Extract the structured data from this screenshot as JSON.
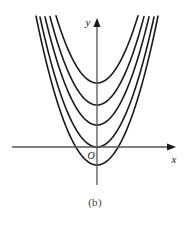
{
  "figure": {
    "caption": "(b)",
    "background_color": "#ffffff",
    "width": 190,
    "height": 226
  },
  "axes": {
    "x_label": "x",
    "y_label": "y",
    "origin_label": "O",
    "axis_color": "#555555",
    "arrow_color": "#1a1a1a",
    "x_axis": {
      "y_px": 147,
      "x_start_px": 12,
      "x_end_px": 176
    },
    "y_axis": {
      "x_px": 97,
      "y_start_px": 18,
      "y_end_px": 185
    }
  },
  "chart_data": {
    "type": "line",
    "title": "",
    "subtitle": "",
    "xlabel": "x",
    "ylabel": "y",
    "grid": false,
    "legend": "none",
    "axis_style": "arrowed-cartesian",
    "curve_color": "#1a1a1a",
    "curve_width_px": 1.6,
    "xlim": [
      -3.4,
      3.4
    ],
    "ylim": [
      -0.9,
      6.2
    ],
    "x_unit_px": 25,
    "y_unit_px": 25,
    "leading_coefficient": 1.0,
    "form": "y = x^2 + c",
    "series": [
      {
        "name": "y = x^2 - 0.72",
        "c": -0.72,
        "vertex": [
          0,
          -0.72
        ],
        "vertex_px": [
          97,
          165
        ]
      },
      {
        "name": "y = x^2 + 0.00",
        "c": 0.0,
        "vertex": [
          0,
          0.0
        ],
        "vertex_px": [
          97,
          147
        ]
      },
      {
        "name": "y = x^2 + 0.88",
        "c": 0.88,
        "vertex": [
          0,
          0.88
        ],
        "vertex_px": [
          97,
          125
        ]
      },
      {
        "name": "y = x^2 + 1.68",
        "c": 1.68,
        "vertex": [
          0,
          1.68
        ],
        "vertex_px": [
          97,
          105
        ]
      },
      {
        "name": "y = x^2 + 2.56",
        "c": 2.56,
        "vertex": [
          0,
          2.56
        ],
        "vertex_px": [
          97,
          83
        ]
      }
    ]
  }
}
